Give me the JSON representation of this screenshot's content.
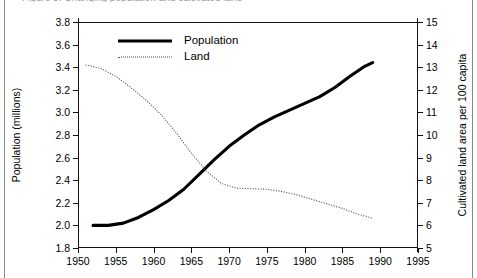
{
  "caption": {
    "text": "Figure 3. Changing population and cultivated land"
  },
  "legend": {
    "position": "inside-top-left",
    "items": [
      {
        "label": "Population",
        "style": "solid-thick",
        "color": "#000000"
      },
      {
        "label": "Land",
        "style": "dotted-thin",
        "color": "#555555"
      }
    ]
  },
  "chart_data": {
    "type": "line",
    "title": "",
    "xlabel": "",
    "ylabel": "Population (millions)",
    "y2label": "Cultivated land area per 100 capita",
    "xlim": [
      1950,
      1995
    ],
    "ylim": [
      1.8,
      3.8
    ],
    "y2lim": [
      5,
      15
    ],
    "xticks": [
      1950,
      1955,
      1960,
      1965,
      1970,
      1975,
      1980,
      1985,
      1990,
      1995
    ],
    "yticks": [
      1.8,
      2.0,
      2.2,
      2.4,
      2.6,
      2.8,
      3.0,
      3.2,
      3.4,
      3.6,
      3.8
    ],
    "y2ticks": [
      5,
      6,
      7,
      8,
      9,
      10,
      11,
      12,
      13,
      14,
      15
    ],
    "grid": false,
    "series": [
      {
        "name": "Population",
        "axis": "left",
        "units": "millions",
        "color": "#000000",
        "x": [
          1952,
          1954,
          1956,
          1958,
          1960,
          1962,
          1964,
          1966,
          1968,
          1970,
          1972,
          1974,
          1976,
          1978,
          1980,
          1982,
          1984,
          1986,
          1988,
          1989
        ],
        "values": [
          2.0,
          2.0,
          2.02,
          2.07,
          2.14,
          2.22,
          2.32,
          2.45,
          2.58,
          2.7,
          2.8,
          2.89,
          2.96,
          3.02,
          3.08,
          3.14,
          3.22,
          3.32,
          3.41,
          3.44
        ]
      },
      {
        "name": "Land",
        "axis": "right",
        "units": "cultivated land area per 100 capita",
        "color": "#555555",
        "x": [
          1951,
          1953,
          1955,
          1957,
          1959,
          1961,
          1963,
          1965,
          1967,
          1969,
          1971,
          1973,
          1975,
          1977,
          1979,
          1981,
          1983,
          1985,
          1987,
          1989
        ],
        "values": [
          13.1,
          12.95,
          12.6,
          12.1,
          11.55,
          10.9,
          10.1,
          9.2,
          8.4,
          7.85,
          7.65,
          7.62,
          7.6,
          7.5,
          7.35,
          7.15,
          6.95,
          6.75,
          6.5,
          6.32
        ]
      }
    ],
    "annotations": [
      {
        "kind": "crossover",
        "year": 1966,
        "population": 2.55,
        "land": 9.0
      }
    ]
  }
}
